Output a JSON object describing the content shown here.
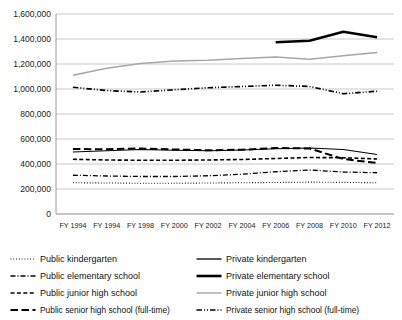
{
  "chart_data": {
    "type": "line",
    "title": "",
    "xlabel": "",
    "ylabel": "",
    "grid": true,
    "legend_position": "bottom",
    "ylim": [
      0,
      1600000
    ],
    "ytick_step": 200000,
    "ytick_labels": [
      "0",
      "200,000",
      "400,000",
      "600,000",
      "800,000",
      "1,000,000",
      "1,200,000",
      "1,400,000",
      "1,600,000"
    ],
    "ytick_values": [
      0,
      200000,
      400000,
      600000,
      800000,
      1000000,
      1200000,
      1400000,
      1600000
    ],
    "categories": [
      "FY 1994",
      "FY 1994",
      "FY 1998",
      "FY 2000",
      "FY 2002",
      "FY 2004",
      "FY 2006",
      "FY 2008",
      "FY 2010",
      "FY 2012"
    ],
    "series": [
      {
        "name": "Public kindergarten",
        "style": "dotted",
        "color": "#000000",
        "width": 1.1,
        "values": [
          250000,
          248000,
          246000,
          246000,
          248000,
          250000,
          252000,
          255000,
          253000,
          250000
        ]
      },
      {
        "name": "Public elementary school",
        "style": "dashdot",
        "color": "#000000",
        "width": 1.3,
        "values": [
          310000,
          304000,
          300000,
          300000,
          306000,
          318000,
          338000,
          352000,
          336000,
          330000
        ]
      },
      {
        "name": "Public junior high school",
        "style": "dashed",
        "color": "#000000",
        "width": 1.6,
        "values": [
          438000,
          432000,
          430000,
          430000,
          432000,
          436000,
          444000,
          452000,
          450000,
          440000
        ]
      },
      {
        "name": "Public senior high school (full-time)",
        "style": "longdash",
        "color": "#000000",
        "width": 2.0,
        "values": [
          520000,
          518000,
          524000,
          516000,
          510000,
          514000,
          528000,
          524000,
          440000,
          408000
        ]
      },
      {
        "name": "Private kindergarten",
        "style": "solid",
        "color": "#000000",
        "width": 1.2,
        "values": [
          496000,
          506000,
          516000,
          510000,
          506000,
          512000,
          522000,
          528000,
          516000,
          476000
        ]
      },
      {
        "name": "Private elementary school",
        "style": "solid-thick",
        "color": "#000000",
        "width": 2.6,
        "values": [
          null,
          null,
          null,
          null,
          null,
          null,
          1374000,
          1386000,
          1458000,
          1414000
        ]
      },
      {
        "name": "Private junior high school",
        "style": "solid-gray",
        "color": "#a6a6a6",
        "width": 1.3,
        "values": [
          1110000,
          1166000,
          1204000,
          1224000,
          1230000,
          1244000,
          1256000,
          1238000,
          1266000,
          1292000
        ]
      },
      {
        "name": "Private senior high school (full-time)",
        "style": "dashdotdot",
        "color": "#000000",
        "width": 1.7,
        "values": [
          1014000,
          988000,
          976000,
          994000,
          1010000,
          1020000,
          1030000,
          1020000,
          962000,
          982000
        ]
      }
    ]
  },
  "legend": {
    "left_column": [
      {
        "label": "Public kindergarten",
        "swatch": "dotted"
      },
      {
        "label": "Public elementary school",
        "swatch": "dashdot"
      },
      {
        "label": "Public junior high school",
        "swatch": "dashed"
      },
      {
        "label": "Public senior high school (full-time)",
        "swatch": "longdash"
      }
    ],
    "right_column": [
      {
        "label": "Private kindergarten",
        "swatch": "solid"
      },
      {
        "label": "Private elementary school",
        "swatch": "solid-thick"
      },
      {
        "label": "Private junior high school",
        "swatch": "solid-gray"
      },
      {
        "label": "Private senior high school (full-time)",
        "swatch": "dashdotdot"
      }
    ]
  },
  "colors": {
    "gridline": "#b3b3b3",
    "axis": "#808080",
    "series_black": "#000000",
    "series_gray": "#a6a6a6",
    "background": "#ffffff"
  }
}
